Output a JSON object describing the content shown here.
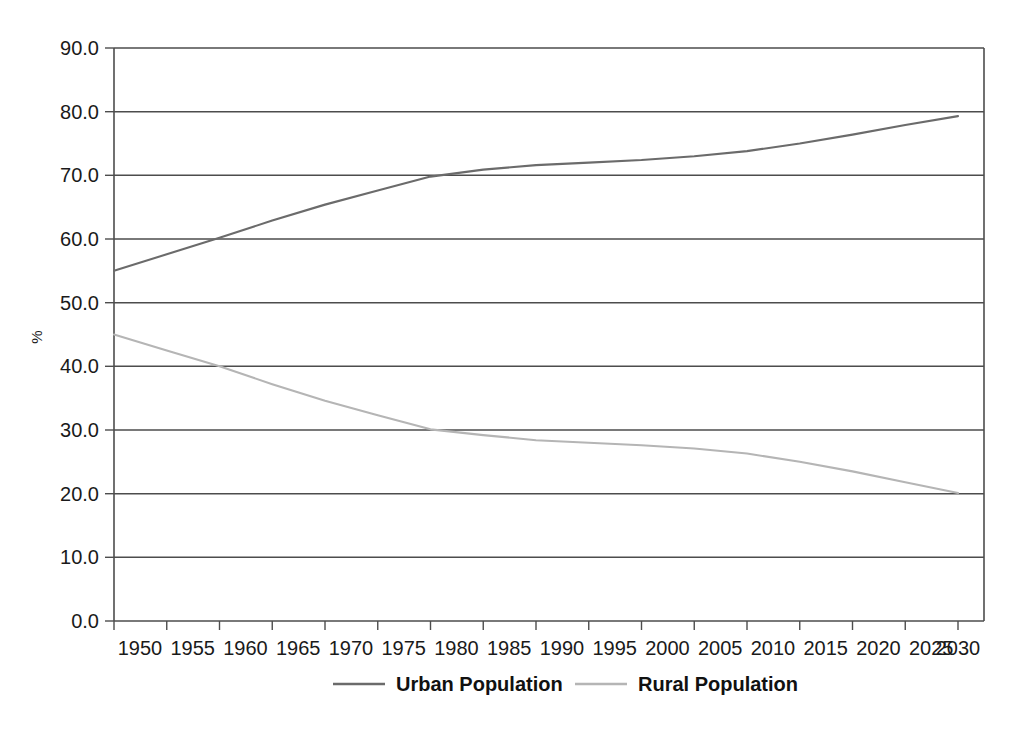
{
  "chart_data": {
    "type": "line",
    "title": "",
    "xlabel": "",
    "ylabel": "%",
    "xlim": [
      1950,
      2030
    ],
    "ylim": [
      0.0,
      90.0
    ],
    "grid": true,
    "legend_position": "bottom",
    "x_tick_labels": [
      "1950",
      "1955",
      "1960",
      "1965",
      "1970",
      "1975",
      "1980",
      "1985",
      "1990",
      "1995",
      "2000",
      "2005",
      "2010",
      "2015",
      "2020",
      "2025",
      "2030"
    ],
    "y_tick_labels": [
      "90.0",
      "80.0",
      "70.0",
      "60.0",
      "50.0",
      "40.0",
      "30.0",
      "20.0",
      "10.0",
      "0.0"
    ],
    "x": [
      1950,
      1955,
      1960,
      1965,
      1970,
      1975,
      1980,
      1985,
      1990,
      1995,
      2000,
      2005,
      2010,
      2015,
      2020,
      2025,
      2030
    ],
    "series": [
      {
        "name": "Urban Population",
        "color": "#6b6b6b",
        "values": [
          55.0,
          57.6,
          60.2,
          62.9,
          65.4,
          67.6,
          69.8,
          70.9,
          71.6,
          72.0,
          72.4,
          73.0,
          73.8,
          75.0,
          76.4,
          77.9,
          79.3
        ]
      },
      {
        "name": "Rural Population",
        "color": "#b5b5b5",
        "values": [
          45.0,
          42.5,
          40.0,
          37.2,
          34.6,
          32.3,
          30.1,
          29.2,
          28.4,
          28.0,
          27.6,
          27.1,
          26.3,
          25.0,
          23.5,
          21.8,
          20.1
        ]
      }
    ]
  },
  "legend": {
    "items": [
      {
        "label": "Urban Population",
        "color": "#6b6b6b"
      },
      {
        "label": "Rural Population",
        "color": "#b5b5b5"
      }
    ]
  },
  "axes": {
    "y_axis_title": "%"
  },
  "colors": {
    "axis": "#4d4d4d",
    "grid": "#4d4d4d",
    "background": "#ffffff",
    "text": "#1a1a1a"
  }
}
